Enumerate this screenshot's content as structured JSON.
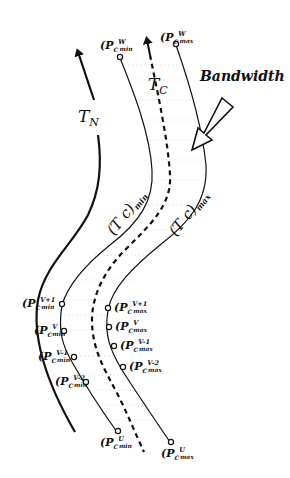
{
  "diagram": {
    "labels": {
      "tn": "T",
      "tn_sub": "N",
      "tc": "T",
      "tc_sub": "C",
      "bandwidth": "Bandwidth",
      "tc_min": "(T c)",
      "tc_min_sub": "min",
      "tc_max": "(T c)",
      "tc_max_sub": "max"
    },
    "points": {
      "min_top": {
        "base": "(P",
        "sub": "C",
        "sup": "W",
        "subsub": "min"
      },
      "max_top": {
        "base": "(P",
        "sub": "C",
        "sup": "W",
        "subsub": "max"
      },
      "min_v1": {
        "base": "(P",
        "sub": "C",
        "sup": "V+1",
        "subsub": "min"
      },
      "min_v": {
        "base": "(P",
        "sub": "C",
        "sup": "V",
        "subsub": "min"
      },
      "min_vm1": {
        "base": "(P",
        "sub": "C",
        "sup": "V-1",
        "subsub": "min"
      },
      "min_vm2": {
        "base": "(P",
        "sub": "C",
        "sup": "V-2",
        "subsub": "min"
      },
      "max_v1": {
        "base": "(P",
        "sub": "C",
        "sup": "V+1",
        "subsub": "max"
      },
      "max_v": {
        "base": "(P",
        "sub": "C",
        "sup": "V",
        "subsub": "max"
      },
      "max_vm1": {
        "base": "(P",
        "sub": "C",
        "sup": "V-1",
        "subsub": "max"
      },
      "max_vm2": {
        "base": "(P",
        "sub": "C",
        "sup": "V-2",
        "subsub": "max"
      },
      "min_bottom": {
        "base": "(P",
        "sub": "C",
        "sup": "U",
        "subsub": "min"
      },
      "max_bottom": {
        "base": "(P",
        "sub": "C",
        "sup": "U",
        "subsub": "max"
      }
    },
    "colors": {
      "ink": "#111111",
      "grid": "#bbbbbb",
      "background": "#ffffff"
    }
  }
}
